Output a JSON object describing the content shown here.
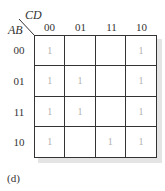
{
  "kmap": {
    "column_variable": "CD",
    "row_variable": "AB",
    "column_labels": [
      "00",
      "01",
      "11",
      "10"
    ],
    "row_labels": [
      "00",
      "01",
      "11",
      "10"
    ],
    "cells": [
      [
        "1",
        "",
        "",
        "1"
      ],
      [
        "1",
        "1",
        "",
        "1"
      ],
      [
        "1",
        "1",
        "",
        "1"
      ],
      [
        "1",
        "",
        "1",
        "1"
      ]
    ],
    "caption": "(d)"
  }
}
